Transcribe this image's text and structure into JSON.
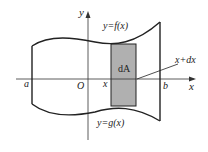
{
  "figure": {
    "axes": {
      "x_label": "x",
      "y_label": "y",
      "origin_label": "O"
    },
    "curves": {
      "upper": "y=f(x)",
      "lower": "y=g(x)"
    },
    "bounds": {
      "left": "a",
      "right": "b"
    },
    "strip": {
      "label": "dA",
      "left_edge_label": "x",
      "right_edge_label": "x+dx",
      "fill_color": "#b0b0b0"
    },
    "colors": {
      "stroke": "#222222",
      "background": "#ffffff"
    }
  }
}
